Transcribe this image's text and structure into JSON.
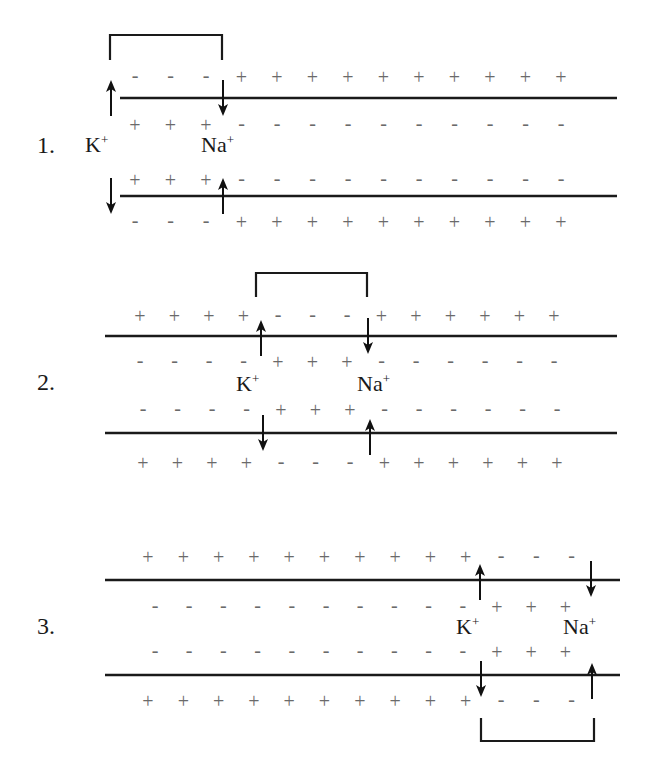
{
  "diagram": {
    "colors": {
      "lines": "#1a1a1a",
      "signs": "#6a6a6a",
      "background": "#ffffff"
    },
    "panels": [
      {
        "step_label": "1.",
        "k_label": "K",
        "na_label": "Na",
        "superscript": "+",
        "rows": {
          "top_outer": [
            "-",
            "-",
            "-",
            "+",
            "+",
            "+",
            "+",
            "+",
            "+",
            "+",
            "+",
            "+",
            "+"
          ],
          "top_inner": [
            "+",
            "+",
            "+",
            "-",
            "-",
            "-",
            "-",
            "-",
            "-",
            "-",
            "-",
            "-",
            "-"
          ],
          "bottom_inner": [
            "+",
            "+",
            "+",
            "-",
            "-",
            "-",
            "-",
            "-",
            "-",
            "-",
            "-",
            "-",
            "-"
          ],
          "bottom_outer": [
            "-",
            "-",
            "-",
            "+",
            "+",
            "+",
            "+",
            "+",
            "+",
            "+",
            "+",
            "+",
            "+"
          ]
        },
        "bracket_position": "top"
      },
      {
        "step_label": "2.",
        "k_label": "K",
        "na_label": "Na",
        "superscript": "+",
        "rows": {
          "top_outer": [
            "+",
            "+",
            "+",
            "+",
            "-",
            "-",
            "-",
            "+",
            "+",
            "+",
            "+",
            "+",
            "+"
          ],
          "top_inner": [
            "-",
            "-",
            "-",
            "-",
            "+",
            "+",
            "+",
            "-",
            "-",
            "-",
            "-",
            "-",
            "-"
          ],
          "bottom_inner": [
            "-",
            "-",
            "-",
            "-",
            "+",
            "+",
            "+",
            "-",
            "-",
            "-",
            "-",
            "-",
            "-"
          ],
          "bottom_outer": [
            "+",
            "+",
            "+",
            "+",
            "-",
            "-",
            "-",
            "+",
            "+",
            "+",
            "+",
            "+",
            "+"
          ]
        },
        "bracket_position": "top"
      },
      {
        "step_label": "3.",
        "k_label": "K",
        "na_label": "Na",
        "superscript": "+",
        "rows": {
          "top_outer": [
            "+",
            "+",
            "+",
            "+",
            "+",
            "+",
            "+",
            "+",
            "+",
            "+",
            "-",
            "-",
            "-"
          ],
          "top_inner": [
            "-",
            "-",
            "-",
            "-",
            "-",
            "-",
            "-",
            "-",
            "-",
            "-",
            "+",
            "+",
            "+"
          ],
          "bottom_inner": [
            "-",
            "-",
            "-",
            "-",
            "-",
            "-",
            "-",
            "-",
            "-",
            "-",
            "+",
            "+",
            "+"
          ],
          "bottom_outer": [
            "+",
            "+",
            "+",
            "+",
            "+",
            "+",
            "+",
            "+",
            "+",
            "+",
            "-",
            "-",
            "-"
          ]
        },
        "bracket_position": "bottom"
      }
    ]
  }
}
